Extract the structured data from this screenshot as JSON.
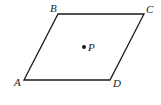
{
  "figure": {
    "type": "parallelogram",
    "stroke_color": "#1a1a1a",
    "background": "#ffffff",
    "vertices": [
      {
        "name": "A",
        "x": 24,
        "y": 80,
        "label_x": 14,
        "label_y": 86
      },
      {
        "name": "B",
        "x": 58,
        "y": 14,
        "label_x": 50,
        "label_y": 12
      },
      {
        "name": "C",
        "x": 144,
        "y": 14,
        "label_x": 146,
        "label_y": 13
      },
      {
        "name": "D",
        "x": 110,
        "y": 80,
        "label_x": 113,
        "label_y": 87
      }
    ],
    "point": {
      "name": "P",
      "x": 84,
      "y": 47,
      "label_x": 88,
      "label_y": 51
    }
  }
}
